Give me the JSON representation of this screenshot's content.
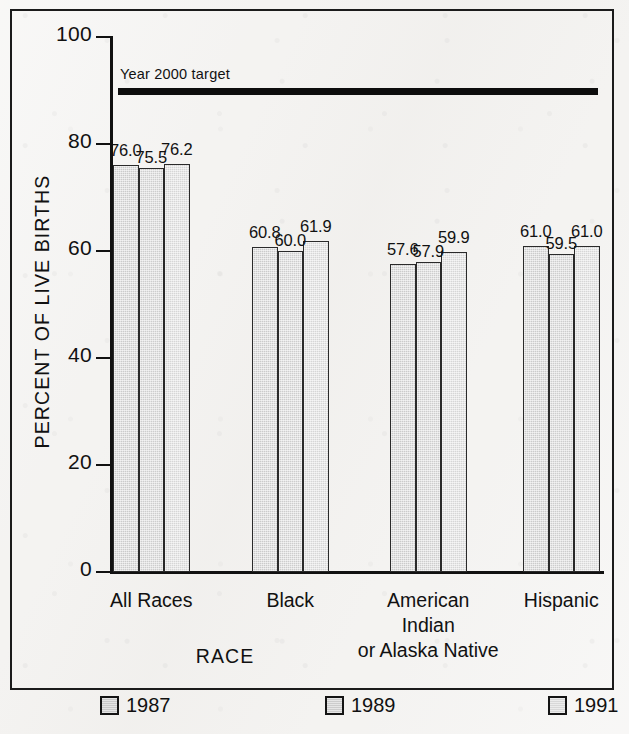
{
  "chart_data": {
    "type": "bar",
    "title": "",
    "xlabel": "RACE",
    "ylabel": "PERCENT OF LIVE BIRTHS",
    "ylim": [
      0,
      100
    ],
    "ytick_labels": [
      "0",
      "20",
      "40",
      "60",
      "80",
      "100"
    ],
    "ytick_values": [
      0,
      20,
      40,
      60,
      80,
      100
    ],
    "grid": false,
    "legend_position": "bottom",
    "categories": [
      "All Races",
      "Black",
      "American Indian or Alaska Native",
      "Hispanic"
    ],
    "category_label_lines": [
      [
        "All Races"
      ],
      [
        "Black"
      ],
      [
        "American",
        "Indian",
        "or Alaska Native"
      ],
      [
        "Hispanic"
      ]
    ],
    "series": [
      {
        "name": "1987",
        "values": [
          76.0,
          60.8,
          57.6,
          61.0
        ],
        "value_labels": [
          "76.0",
          "60.8",
          "57.6",
          "61.0"
        ],
        "color": "#cbcbcb"
      },
      {
        "name": "1989",
        "values": [
          75.5,
          60.0,
          57.9,
          59.5
        ],
        "value_labels": [
          "75.5",
          "60.0",
          "57.9",
          "59.5"
        ],
        "color": "#cdcdcd"
      },
      {
        "name": "1991",
        "values": [
          76.2,
          61.9,
          59.9,
          61.0
        ],
        "value_labels": [
          "76.2",
          "61.9",
          "59.9",
          "61.0"
        ],
        "color": "#d6d6d6"
      }
    ],
    "annotations": [
      {
        "name": "year-2000-target",
        "label": "Year 2000 target",
        "value": 90,
        "style": "thick-black-rule",
        "color": "#0d0d0d"
      }
    ]
  },
  "axis": {
    "y_title": "PERCENT OF LIVE BIRTHS",
    "x_title": "RACE"
  },
  "target": {
    "label": "Year 2000 target"
  },
  "legend": {
    "items": [
      {
        "label": "1987"
      },
      {
        "label": "1989"
      },
      {
        "label": "1991"
      }
    ]
  }
}
